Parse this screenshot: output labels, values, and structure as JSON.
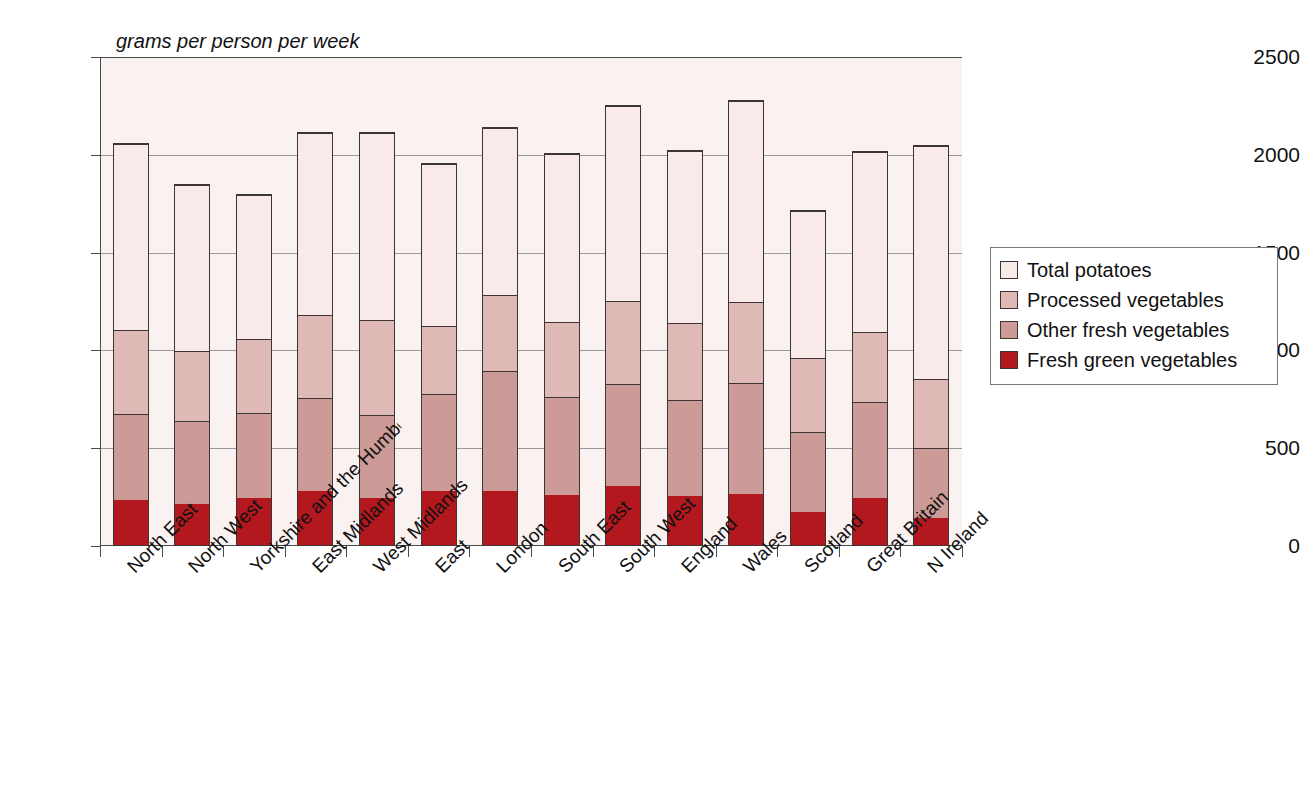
{
  "chart_data": {
    "type": "bar",
    "subtype": "stacked-column",
    "title": "",
    "unit_caption": "grams per person per week",
    "xlabel": "",
    "ylabel": "",
    "ylim": [
      0,
      2500
    ],
    "ytick_values": [
      0,
      500,
      1000,
      1500,
      2000,
      2500
    ],
    "ytick_labels": [
      "0",
      "500",
      "1000",
      "1500",
      "2000",
      "2500"
    ],
    "grid": true,
    "grid_axis": "y",
    "legend_position": "right",
    "categories": [
      "North East",
      "North West",
      "Yorkshire and the Humber",
      "East Midlands",
      "West Midlands",
      "East",
      "London",
      "South East",
      "South West",
      "England",
      "Wales",
      "Scotland",
      "Great Britain",
      "N Ireland"
    ],
    "series": [
      {
        "name": "Fresh green vegetables",
        "color": "#b3181f",
        "values": [
          230,
          210,
          240,
          275,
          240,
          275,
          275,
          255,
          300,
          250,
          260,
          170,
          240,
          140
        ]
      },
      {
        "name": "Other fresh vegetables",
        "color": "#cc9a97",
        "values": [
          440,
          425,
          435,
          475,
          425,
          495,
          615,
          500,
          525,
          490,
          570,
          410,
          490,
          355
        ]
      },
      {
        "name": "Processed vegetables",
        "color": "#deb9b6",
        "values": [
          430,
          355,
          380,
          425,
          485,
          350,
          390,
          385,
          425,
          395,
          415,
          375,
          360,
          355
        ]
      },
      {
        "name": "Total potatoes",
        "color": "#f7eae8",
        "values": [
          950,
          850,
          735,
          930,
          955,
          830,
          850,
          860,
          995,
          880,
          1025,
          755,
          920,
          1190
        ]
      }
    ],
    "totals": [
      2050,
      1840,
      1790,
      2105,
      2105,
      1950,
      2130,
      2000,
      2245,
      2015,
      2270,
      1710,
      2010,
      2040
    ]
  },
  "legend": {
    "items": [
      {
        "label": "Total potatoes",
        "color": "#f7eae8"
      },
      {
        "label": "Processed vegetables",
        "color": "#deb9b6"
      },
      {
        "label": "Other fresh vegetables",
        "color": "#cc9a97"
      },
      {
        "label": "Fresh green vegetables",
        "color": "#b3181f"
      }
    ]
  }
}
